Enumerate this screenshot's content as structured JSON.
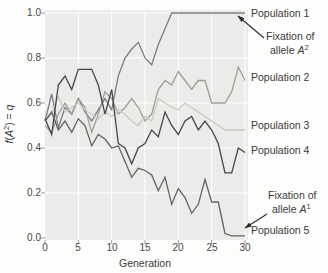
{
  "figure": {
    "xlabel": "Generation",
    "ylabel_parts": {
      "f": "f",
      "pre": "(",
      "A": "A",
      "sup": "2",
      "post": ") = ",
      "q": "q"
    },
    "x_tick_labels": [
      "0",
      "5",
      "10",
      "15",
      "20",
      "25",
      "30"
    ],
    "y_tick_labels": [
      "1.0",
      "0.8",
      "0.6",
      "0.4",
      "0.2",
      "0.0"
    ]
  },
  "annotations": {
    "pop1_label": "Population 1",
    "pop2_label": "Population 2",
    "pop3_label": "Population 3",
    "pop4_label": "Population 4",
    "pop5_label": "Population 5",
    "fixation_top_line1": "Fixation of",
    "fixation_top_word": "allele ",
    "fixation_top_allele": "A",
    "fixation_top_sup": "2",
    "fixation_bottom_line1": "Fixation of",
    "fixation_bottom_word": "allele ",
    "fixation_bottom_allele": "A",
    "fixation_bottom_sup": "1"
  },
  "chart_data": {
    "type": "line",
    "xlabel": "Generation",
    "ylabel": "f(A2) = q",
    "xlim": [
      0,
      30
    ],
    "ylim": [
      0.0,
      1.0
    ],
    "x_ticks": [
      0,
      5,
      10,
      15,
      20,
      25,
      30
    ],
    "y_ticks": [
      0.0,
      0.2,
      0.4,
      0.6,
      0.8,
      1.0
    ],
    "grid": true,
    "plot_bg": "#ebebe9",
    "grid_color": "#ffffff",
    "tick_color": "#9a9a9a",
    "annotation_notes": [
      "Population 1 reaches fixation of allele A2 (q = 1.0) by generation ~19",
      "Population 5 reaches fixation of allele A1 (q = 0) by generation ~27"
    ],
    "x": [
      0,
      1,
      2,
      3,
      4,
      5,
      6,
      7,
      8,
      9,
      10,
      11,
      12,
      13,
      14,
      15,
      16,
      17,
      18,
      19,
      20,
      21,
      22,
      23,
      24,
      25,
      26,
      27,
      28,
      29,
      30
    ],
    "series": [
      {
        "name": "Population 1",
        "color": "#7d7a85",
        "values": [
          0.52,
          0.64,
          0.49,
          0.58,
          0.55,
          0.62,
          0.56,
          0.52,
          0.57,
          0.62,
          0.57,
          0.72,
          0.8,
          0.84,
          0.87,
          0.8,
          0.77,
          0.86,
          0.93,
          1.0,
          1.0,
          1.0,
          1.0,
          1.0,
          1.0,
          1.0,
          1.0,
          1.0,
          1.0,
          1.0,
          1.0
        ]
      },
      {
        "name": "Population 2",
        "color": "#9ba092",
        "values": [
          0.5,
          0.47,
          0.55,
          0.6,
          0.55,
          0.62,
          0.58,
          0.47,
          0.55,
          0.65,
          0.62,
          0.55,
          0.58,
          0.62,
          0.58,
          0.52,
          0.55,
          0.66,
          0.7,
          0.68,
          0.74,
          0.7,
          0.66,
          0.7,
          0.7,
          0.6,
          0.6,
          0.6,
          0.65,
          0.76,
          0.7
        ]
      },
      {
        "name": "Population 3",
        "color": "#c9ccc0",
        "values": [
          0.52,
          0.55,
          0.63,
          0.56,
          0.58,
          0.6,
          0.57,
          0.55,
          0.53,
          0.56,
          0.54,
          0.57,
          0.55,
          0.52,
          0.5,
          0.54,
          0.52,
          0.62,
          0.6,
          0.58,
          0.57,
          0.6,
          0.58,
          0.56,
          0.54,
          0.52,
          0.5,
          0.48,
          0.48,
          0.48,
          0.48
        ]
      },
      {
        "name": "Population 4",
        "color": "#46464e",
        "values": [
          0.53,
          0.46,
          0.68,
          0.72,
          0.66,
          0.75,
          0.75,
          0.75,
          0.68,
          0.55,
          0.66,
          0.42,
          0.4,
          0.33,
          0.4,
          0.42,
          0.48,
          0.45,
          0.56,
          0.5,
          0.46,
          0.52,
          0.54,
          0.48,
          0.52,
          0.48,
          0.42,
          0.29,
          0.29,
          0.4,
          0.38
        ]
      },
      {
        "name": "Population 5",
        "color": "#66625f",
        "values": [
          0.52,
          0.56,
          0.48,
          0.52,
          0.47,
          0.53,
          0.5,
          0.41,
          0.46,
          0.44,
          0.4,
          0.41,
          0.34,
          0.27,
          0.31,
          0.3,
          0.28,
          0.21,
          0.27,
          0.15,
          0.22,
          0.18,
          0.11,
          0.15,
          0.26,
          0.16,
          0.16,
          0.02,
          0.01,
          0.01,
          0.01
        ]
      }
    ]
  }
}
